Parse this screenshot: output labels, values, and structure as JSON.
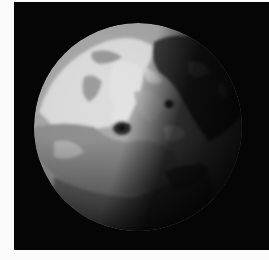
{
  "image": {
    "subject": "grayscale moon",
    "background_color": "#050505",
    "border_color": "#fafafa",
    "sphere": {
      "cx": 124,
      "cy": 125,
      "r": 104,
      "lit_color": "#d9d9d9",
      "mid_color": "#9a9a9a",
      "shadow_color": "#2a2a2a"
    }
  }
}
